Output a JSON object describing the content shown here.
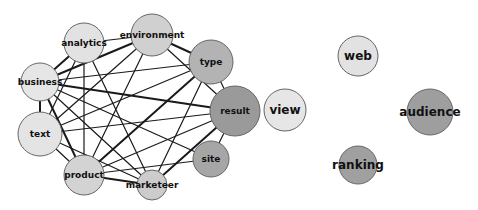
{
  "diagram": {
    "type": "network-graph",
    "nodes": [
      {
        "id": "analytics",
        "label": "analytics",
        "shade": "#e2e2e2",
        "component": 1
      },
      {
        "id": "environment",
        "label": "environment",
        "shade": "#d0d0d0",
        "component": 1
      },
      {
        "id": "type",
        "label": "type",
        "shade": "#b3b3b3",
        "component": 1
      },
      {
        "id": "result",
        "label": "result",
        "shade": "#9a9a9a",
        "component": 1
      },
      {
        "id": "site",
        "label": "site",
        "shade": "#a6a6a6",
        "component": 1
      },
      {
        "id": "marketeer",
        "label": "marketeer",
        "shade": "#cccccc",
        "component": 1
      },
      {
        "id": "product",
        "label": "product",
        "shade": "#d3d3d3",
        "component": 1
      },
      {
        "id": "text",
        "label": "text",
        "shade": "#e4e4e4",
        "component": 1
      },
      {
        "id": "business",
        "label": "business",
        "shade": "#e6e6e6",
        "component": 1
      },
      {
        "id": "view",
        "label": "view",
        "shade": "#e6e6e6",
        "component": 2
      },
      {
        "id": "web",
        "label": "web",
        "shade": "#e2e2e2",
        "component": 3
      },
      {
        "id": "audience",
        "label": "audience",
        "shade": "#9e9e9e",
        "component": 4
      },
      {
        "id": "ranking",
        "label": "ranking",
        "shade": "#a0a0a0",
        "component": 5
      }
    ],
    "edges": [
      {
        "source": "analytics",
        "target": "environment",
        "weight": 1
      },
      {
        "source": "analytics",
        "target": "business",
        "weight": 2
      },
      {
        "source": "analytics",
        "target": "text",
        "weight": 1
      },
      {
        "source": "analytics",
        "target": "marketeer",
        "weight": 1
      },
      {
        "source": "analytics",
        "target": "product",
        "weight": 1
      },
      {
        "source": "environment",
        "target": "business",
        "weight": 2
      },
      {
        "source": "environment",
        "target": "type",
        "weight": 2
      },
      {
        "source": "environment",
        "target": "result",
        "weight": 1
      },
      {
        "source": "environment",
        "target": "text",
        "weight": 1
      },
      {
        "source": "environment",
        "target": "product",
        "weight": 1
      },
      {
        "source": "type",
        "target": "business",
        "weight": 1
      },
      {
        "source": "type",
        "target": "result",
        "weight": 1
      },
      {
        "source": "type",
        "target": "text",
        "weight": 1
      },
      {
        "source": "type",
        "target": "product",
        "weight": 2
      },
      {
        "source": "type",
        "target": "marketeer",
        "weight": 1
      },
      {
        "source": "result",
        "target": "business",
        "weight": 2
      },
      {
        "source": "result",
        "target": "text",
        "weight": 1
      },
      {
        "source": "result",
        "target": "product",
        "weight": 1
      },
      {
        "source": "result",
        "target": "marketeer",
        "weight": 2
      },
      {
        "source": "result",
        "target": "site",
        "weight": 1
      },
      {
        "source": "site",
        "target": "business",
        "weight": 1
      },
      {
        "source": "site",
        "target": "product",
        "weight": 1
      },
      {
        "source": "marketeer",
        "target": "business",
        "weight": 1
      },
      {
        "source": "marketeer",
        "target": "text",
        "weight": 1
      },
      {
        "source": "marketeer",
        "target": "product",
        "weight": 2
      },
      {
        "source": "product",
        "target": "text",
        "weight": 1
      },
      {
        "source": "product",
        "target": "business",
        "weight": 2
      },
      {
        "source": "text",
        "target": "business",
        "weight": 2
      }
    ]
  }
}
